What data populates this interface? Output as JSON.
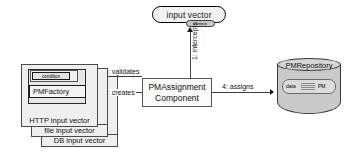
{
  "diagram": {
    "type": "uml-collaboration-diagram",
    "background_color": "#ffffff",
    "line_color": "#3a3a3a"
  },
  "nodes": {
    "input_vector": {
      "label": "input vector",
      "badge_label": "context",
      "shape": "rounded-rectangle",
      "fill": "#f1f1f1"
    },
    "component": {
      "line1": "PMAssignment",
      "line2": "Component",
      "shape": "rectangle",
      "fill": "#fafafa"
    },
    "repository": {
      "label": "PMRepository",
      "shape": "cylinder",
      "fill": "#c9c9c9",
      "inner": {
        "left_label": "data",
        "right_label": "PM"
      }
    },
    "input_stack": [
      {
        "label": "HTTP input vector"
      },
      {
        "label": "file input vector"
      },
      {
        "label": "DB input vector"
      }
    ],
    "inner_boxes": {
      "condition": "condition",
      "factory": "PMFactory"
    }
  },
  "messages": [
    {
      "id": 1,
      "label": "1: intercepts",
      "orientation": "vertical",
      "direction": "up"
    },
    {
      "id": 2,
      "label": "2: validates",
      "orientation": "horizontal",
      "direction": "left"
    },
    {
      "id": 3,
      "label": "3: creates",
      "orientation": "horizontal",
      "direction": "left"
    },
    {
      "id": 4,
      "label": "4: assigns",
      "orientation": "horizontal",
      "direction": "right"
    }
  ]
}
